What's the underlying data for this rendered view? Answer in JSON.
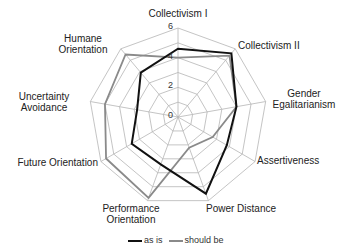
{
  "chart_data": {
    "type": "radar",
    "title": "",
    "axes": [
      "Collectivism I",
      "Collectivism II",
      "Gender Egalitarianism",
      "Assertiveness",
      "Power Distance",
      "Performance Orientation",
      "Future Orientation",
      "Uncertainty Avoidance",
      "Humane Orientation"
    ],
    "axis_labels_display": [
      [
        "Collectivism I"
      ],
      [
        "Collectivism II"
      ],
      [
        "Gender",
        "Egalitarianism"
      ],
      [
        "Assertiveness"
      ],
      [
        "Power Distance"
      ],
      [
        "Performance",
        "Orientation"
      ],
      [
        "Future Orientation"
      ],
      [
        "Uncertainty",
        "Avoidance"
      ],
      [
        "Humane",
        "Orientation"
      ]
    ],
    "radial_ticks": [
      0,
      2,
      4,
      6
    ],
    "rlim": [
      0,
      6
    ],
    "grid": true,
    "legend_position": "bottom",
    "series": [
      {
        "name": "as is",
        "color": "#111111",
        "values": [
          4.6,
          5.6,
          4.0,
          3.8,
          5.5,
          3.4,
          3.6,
          2.8,
          3.9
        ]
      },
      {
        "name": "should be",
        "color": "#8a8a8a",
        "values": [
          4.0,
          5.4,
          4.0,
          2.7,
          2.2,
          5.8,
          5.6,
          5.0,
          5.5
        ]
      }
    ]
  }
}
